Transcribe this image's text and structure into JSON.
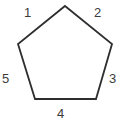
{
  "figure": {
    "type": "geometry-diagram",
    "shape_name": "pentagon",
    "background_color": "#ffffff",
    "stroke_color": "#2e2e2e",
    "stroke_width": 1.8,
    "fill_color": "#ffffff",
    "label_color": "#3b3b3b",
    "label_font_size": 13
  },
  "shape": {
    "points_attr": "65,6 112,44 96,99 35,99 18,44",
    "vertices": [
      {
        "name": "apex",
        "x": 65,
        "y": 6
      },
      {
        "name": "right-upper",
        "x": 112,
        "y": 44
      },
      {
        "name": "right-lower",
        "x": 96,
        "y": 99
      },
      {
        "name": "left-lower",
        "x": 35,
        "y": 99
      },
      {
        "name": "left-upper",
        "x": 18,
        "y": 44
      }
    ]
  },
  "labels": [
    {
      "id": "1",
      "text": "1",
      "side": "upper-left",
      "x": 30,
      "y": 12
    },
    {
      "id": "2",
      "text": "2",
      "side": "upper-right",
      "x": 100,
      "y": 12
    },
    {
      "id": "3",
      "text": "3",
      "side": "right",
      "x": 115,
      "y": 78
    },
    {
      "id": "4",
      "text": "4",
      "side": "bottom",
      "x": 63,
      "y": 113
    },
    {
      "id": "5",
      "text": "5",
      "side": "left",
      "x": 7,
      "y": 78
    }
  ]
}
